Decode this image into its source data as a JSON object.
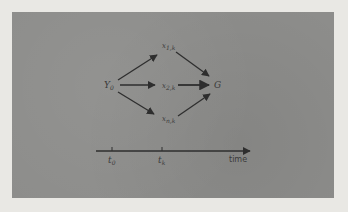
{
  "diagram": {
    "nodes": {
      "start": {
        "base": "Y",
        "sub": "0"
      },
      "top": {
        "base": "x",
        "sub": "1,k"
      },
      "middle": {
        "base": "x",
        "sub": "2,k"
      },
      "bottom": {
        "base": "x",
        "sub": "n,k"
      },
      "goal": {
        "base": "G",
        "sub": ""
      }
    },
    "edges": [
      {
        "from": "start",
        "to": "top"
      },
      {
        "from": "start",
        "to": "middle"
      },
      {
        "from": "start",
        "to": "bottom"
      },
      {
        "from": "top",
        "to": "goal"
      },
      {
        "from": "middle",
        "to": "goal"
      },
      {
        "from": "bottom",
        "to": "goal"
      }
    ],
    "timeline": {
      "ticks": [
        {
          "base": "t",
          "sub": "0"
        },
        {
          "base": "t",
          "sub": "k"
        }
      ],
      "axis_label": "time"
    }
  },
  "colors": {
    "panel": "#8d8d8b",
    "background": "#e9e8e4",
    "ink": "#2e2e2e"
  }
}
